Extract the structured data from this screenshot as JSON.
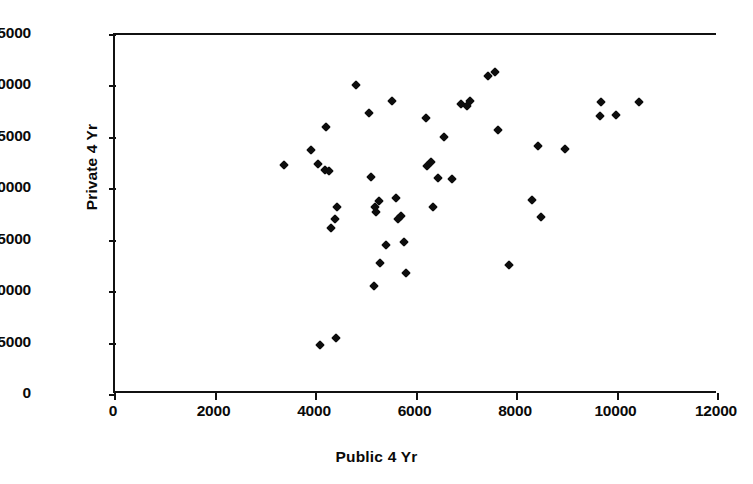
{
  "chart_data": {
    "type": "scatter",
    "title": "",
    "xlabel": "Public 4 Yr",
    "ylabel": "Private 4 Yr",
    "xlim": [
      0,
      12000
    ],
    "ylim": [
      0,
      35000
    ],
    "xticks": [
      0,
      2000,
      4000,
      6000,
      8000,
      10000,
      12000
    ],
    "yticks": [
      0,
      5000,
      10000,
      15000,
      20000,
      25000,
      30000,
      35000
    ],
    "xtick_labels": [
      "0",
      "2000",
      "4000",
      "6000",
      "8000",
      "10000",
      "12000"
    ],
    "ytick_labels": [
      "0",
      "5000",
      "10000",
      "15000",
      "20000",
      "25000",
      "30000",
      "35000"
    ],
    "grid": false,
    "legend": null,
    "marker": "diamond",
    "marker_color": "#0d0d0d",
    "series": [
      {
        "name": "Tuition",
        "points": [
          [
            3360,
            22400
          ],
          [
            3900,
            23800
          ],
          [
            4040,
            22500
          ],
          [
            4180,
            21900
          ],
          [
            4260,
            21800
          ],
          [
            4200,
            26100
          ],
          [
            4300,
            16200
          ],
          [
            4420,
            18300
          ],
          [
            4380,
            17100
          ],
          [
            4080,
            4850
          ],
          [
            4400,
            5550
          ],
          [
            4800,
            30100
          ],
          [
            5060,
            27400
          ],
          [
            5100,
            21200
          ],
          [
            5200,
            17800
          ],
          [
            5260,
            18900
          ],
          [
            5180,
            18300
          ],
          [
            5280,
            12850
          ],
          [
            5150,
            10550
          ],
          [
            5400,
            14600
          ],
          [
            5520,
            28600
          ],
          [
            5600,
            19200
          ],
          [
            5700,
            17400
          ],
          [
            5640,
            17100
          ],
          [
            5760,
            14900
          ],
          [
            5800,
            11900
          ],
          [
            6180,
            26900
          ],
          [
            6280,
            22700
          ],
          [
            6200,
            22300
          ],
          [
            6320,
            18300
          ],
          [
            6420,
            21100
          ],
          [
            6540,
            25100
          ],
          [
            6700,
            21000
          ],
          [
            6880,
            28300
          ],
          [
            7000,
            28100
          ],
          [
            7060,
            28600
          ],
          [
            7420,
            31000
          ],
          [
            7560,
            31400
          ],
          [
            7620,
            25800
          ],
          [
            7840,
            12600
          ],
          [
            8300,
            19000
          ],
          [
            8420,
            24200
          ],
          [
            8480,
            17300
          ],
          [
            8960,
            23900
          ],
          [
            9680,
            28500
          ],
          [
            9660,
            27100
          ],
          [
            9980,
            27200
          ],
          [
            10420,
            28500
          ]
        ]
      }
    ]
  },
  "axes": {
    "y_title": "Private 4 Yr",
    "x_title": "Public 4 Yr"
  }
}
